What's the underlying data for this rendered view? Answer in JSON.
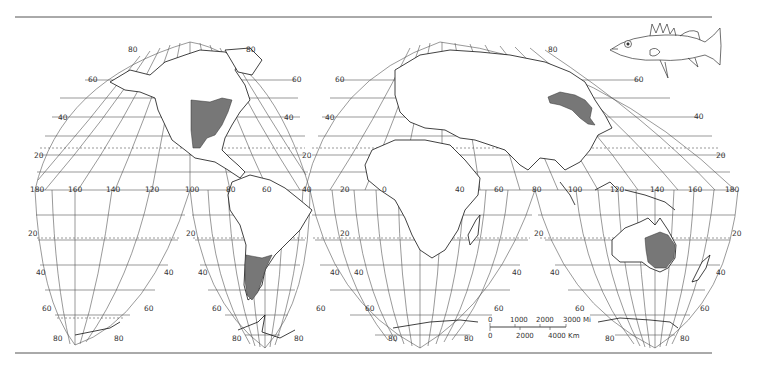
{
  "map": {
    "projection": "Goode homolosine (interrupted)",
    "colors": {
      "background": "#ffffff",
      "grid": "#555555",
      "coast": "#111111",
      "range_fill": "#777777",
      "rule": "#555555"
    },
    "lobes": [
      {
        "name": "north-america",
        "lat_labels_left": [
          "80",
          "60",
          "40",
          "20"
        ],
        "lat_labels_right": [
          "80",
          "60",
          "40",
          "20"
        ]
      },
      {
        "name": "eurasia",
        "lat_labels_left": [
          "80",
          "60",
          "40",
          "20"
        ],
        "lat_labels_right": [
          "80",
          "60",
          "40",
          "20"
        ]
      },
      {
        "name": "south-pacific",
        "lat_labels_left": [
          "20",
          "40",
          "60",
          "80"
        ],
        "lat_labels_right": [
          "40",
          "60",
          "80"
        ]
      },
      {
        "name": "south-america",
        "lat_labels_left": [
          "20",
          "40",
          "60",
          "80"
        ],
        "lat_labels_right": [
          "40",
          "60",
          "80"
        ]
      },
      {
        "name": "africa",
        "lat_labels_left": [
          "20",
          "40",
          "60",
          "80"
        ],
        "lat_labels_right": [
          "20",
          "40",
          "60",
          "80"
        ]
      },
      {
        "name": "australia",
        "lat_labels_left": [
          "40",
          "60",
          "80"
        ],
        "lat_labels_right": [
          "20",
          "40",
          "60",
          "80"
        ]
      }
    ],
    "equator_longitude_labels": [
      "180",
      "160",
      "140",
      "120",
      "100",
      "80",
      "60",
      "40",
      "20",
      "0",
      "20",
      "40",
      "60",
      "80",
      "100",
      "120",
      "140",
      "160",
      "180"
    ],
    "native_ranges": [
      {
        "region": "eastern North America (Mississippi basin / Great Lakes)"
      },
      {
        "region": "southern South America (Argentina)"
      },
      {
        "region": "Amur basin / NE Asia"
      },
      {
        "region": "eastern Australia (Murray–Darling)"
      }
    ],
    "scale_bar": {
      "miles": {
        "ticks": [
          "0",
          "1000",
          "2000",
          "3000"
        ],
        "unit": "Mi"
      },
      "km": {
        "ticks": [
          "0",
          "2000",
          "4000"
        ],
        "unit": "Km"
      }
    },
    "illustration": "perch-like fish"
  },
  "labels": {
    "l80": "80",
    "l60": "60",
    "l40": "40",
    "l20": "20",
    "mi0": "0",
    "mi1000": "1000",
    "mi2000": "2000",
    "mi3000": "3000 Mi",
    "km0": "0",
    "km2000": "2000",
    "km4000": "4000 Km",
    "lon180": "180",
    "lon160": "160",
    "lon140": "140",
    "lon120": "120",
    "lon100": "100",
    "lon80": "80",
    "lon60": "60",
    "lon40": "40",
    "lon20": "20",
    "lon0": "0"
  }
}
